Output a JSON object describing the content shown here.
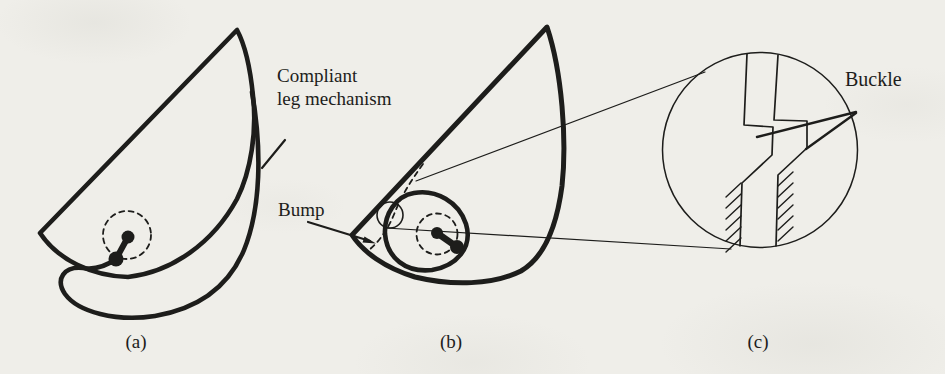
{
  "figure": {
    "type": "diagram",
    "labels": {
      "compliant_line1": "Compliant",
      "compliant_line2": "leg mechanism",
      "bump": "Bump",
      "buckle": "Buckle"
    },
    "panels": [
      {
        "id": "a",
        "caption": "(a)"
      },
      {
        "id": "b",
        "caption": "(b)"
      },
      {
        "id": "c",
        "caption": "(c)"
      }
    ],
    "colors": {
      "ink": "#1d1d1b",
      "paper": "#efeee9"
    }
  }
}
